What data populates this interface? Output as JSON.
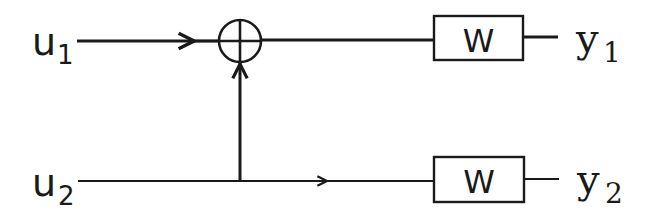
{
  "diagram": {
    "type": "block-diagram",
    "inputs": [
      {
        "id": "u1",
        "base": "u",
        "sub": "1"
      },
      {
        "id": "u2",
        "base": "u",
        "sub": "2"
      }
    ],
    "outputs": [
      {
        "id": "y1",
        "base": "y",
        "sub": "1"
      },
      {
        "id": "y2",
        "base": "y",
        "sub": "2"
      }
    ],
    "blocks": [
      {
        "id": "W1",
        "label": "W"
      },
      {
        "id": "W2",
        "label": "W"
      }
    ],
    "summing_junction": {
      "id": "sum",
      "symbol": "plus-circle"
    },
    "edges": [
      {
        "from": "u1",
        "to": "sum"
      },
      {
        "from": "u2",
        "to": "sum",
        "via": "branch-point"
      },
      {
        "from": "sum",
        "to": "W1"
      },
      {
        "from": "W1",
        "to": "y1"
      },
      {
        "from": "u2",
        "to": "W2"
      },
      {
        "from": "W2",
        "to": "y2"
      }
    ],
    "line_color": "#1a1a1a"
  }
}
